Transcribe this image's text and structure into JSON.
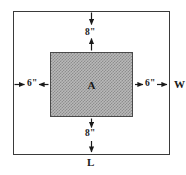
{
  "diagram": {
    "type": "geometry-dimension-diagram",
    "outer_rectangle": {
      "name": "outer-plot",
      "width_label": "W",
      "length_label": "L",
      "stroke_color": "#3a3a3a"
    },
    "inner_rectangle": {
      "name": "shaded-region",
      "area_label": "A",
      "fill_color": "#b9b9b9",
      "pattern": "checkerboard-dither",
      "stroke_color": "#4a4a4a"
    },
    "dimensions": {
      "top_margin": "8\"",
      "bottom_margin": "8\"",
      "left_margin": "6\"",
      "right_margin": "6\""
    },
    "arrows": {
      "top": "double-headed-vertical-arrow",
      "bottom": "double-headed-vertical-arrow",
      "left": "double-headed-horizontal-arrow",
      "right": "double-headed-horizontal-arrow"
    }
  }
}
